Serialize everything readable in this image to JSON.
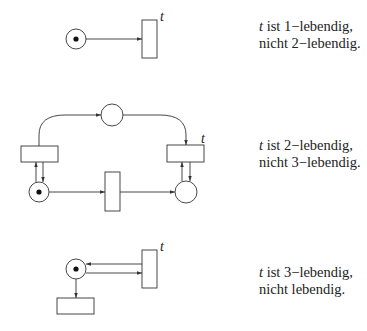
{
  "diagrams": [
    {
      "id": "net-1",
      "transition_label": "t",
      "caption": {
        "var": "t",
        "line1_rest": " ist 1−lebendig,",
        "line2": "nicht 2−lebendig."
      }
    },
    {
      "id": "net-2",
      "transition_label": "t",
      "caption": {
        "var": "t",
        "line1_rest": " ist 2−lebendig,",
        "line2": "nicht 3−lebendig."
      }
    },
    {
      "id": "net-3",
      "transition_label": "t",
      "caption": {
        "var": "t",
        "line1_rest": " ist 3−lebendig,",
        "line2": "nicht lebendig."
      }
    }
  ],
  "colors": {
    "stroke": "#333333",
    "token": "#111111",
    "background": "#ffffff"
  }
}
